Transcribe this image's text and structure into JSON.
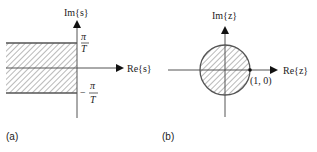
{
  "panel_a": {
    "caption": "(a)",
    "y_axis_label": "Im{s}",
    "x_axis_label": "Re{s}",
    "upper_bound_num": "π",
    "upper_bound_den": "T",
    "lower_bound_sign": "−",
    "lower_bound_num": "π",
    "lower_bound_den": "T",
    "region": "left half-plane strip between −π/T and π/T (hatched)"
  },
  "panel_b": {
    "caption": "(b)",
    "y_axis_label": "Im{z}",
    "x_axis_label": "Re{z}",
    "point_label": "(1, 0)",
    "region": "interior of unit circle (hatched)"
  },
  "colors": {
    "line": "#555555",
    "hatch": "#8a8a8a",
    "text": "#222222"
  }
}
